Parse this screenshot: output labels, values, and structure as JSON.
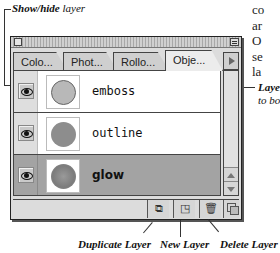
{
  "callouts": {
    "show_hide": {
      "bold": "Show/hide",
      "rest": " layer"
    },
    "layer_right_line1": "Laye",
    "layer_right_line2": "to bo",
    "duplicate_layer": "Duplicate Layer",
    "new_layer": "New Layer",
    "delete_layer": "Delete Layer"
  },
  "body_text_fragments": [
    "co",
    "ar",
    "O",
    "se",
    "la"
  ],
  "palette": {
    "tabs": [
      {
        "label": "Colo...",
        "active": false
      },
      {
        "label": "Phot...",
        "active": false
      },
      {
        "label": "Rollo...",
        "active": false
      },
      {
        "label": "Obje...",
        "active": true
      }
    ],
    "layers": [
      {
        "name": "emboss",
        "thumb": "emboss",
        "visible": true,
        "selected": false
      },
      {
        "name": "outline",
        "thumb": "outline",
        "visible": true,
        "selected": false
      },
      {
        "name": "glow",
        "thumb": "glow",
        "visible": true,
        "selected": true
      }
    ],
    "toolbar": {
      "duplicate_icon": "⧉",
      "new_icon": "◳",
      "delete_icon": "🗑"
    }
  }
}
